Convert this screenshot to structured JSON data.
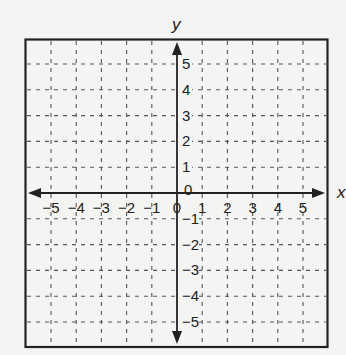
{
  "chart_data": {
    "type": "coordinate-grid",
    "title": "",
    "xlabel": "x",
    "ylabel": "y",
    "xlim": [
      -5,
      5
    ],
    "ylim": [
      -5,
      5
    ],
    "x_ticks": [
      -5,
      -4,
      -3,
      -2,
      -1,
      0,
      1,
      2,
      3,
      4,
      5
    ],
    "y_ticks": [
      -5,
      -4,
      -3,
      -2,
      -1,
      0,
      1,
      2,
      3,
      4,
      5
    ],
    "x_tick_labels": [
      "−5",
      "−4",
      "−3",
      "−2",
      "−1",
      "0",
      "1",
      "2",
      "3",
      "4",
      "5"
    ],
    "y_tick_labels": [
      "−5",
      "−4",
      "−3",
      "−2",
      "−1",
      "0",
      "1",
      "2",
      "3",
      "4",
      "5"
    ],
    "grid": true,
    "grid_style": "dashed",
    "axes_arrows": true,
    "series": []
  },
  "labels": {
    "x_axis": "x",
    "y_axis": "y"
  },
  "colors": {
    "background": "#f4f4f2",
    "lines": "#222222",
    "grid": "#555555"
  }
}
